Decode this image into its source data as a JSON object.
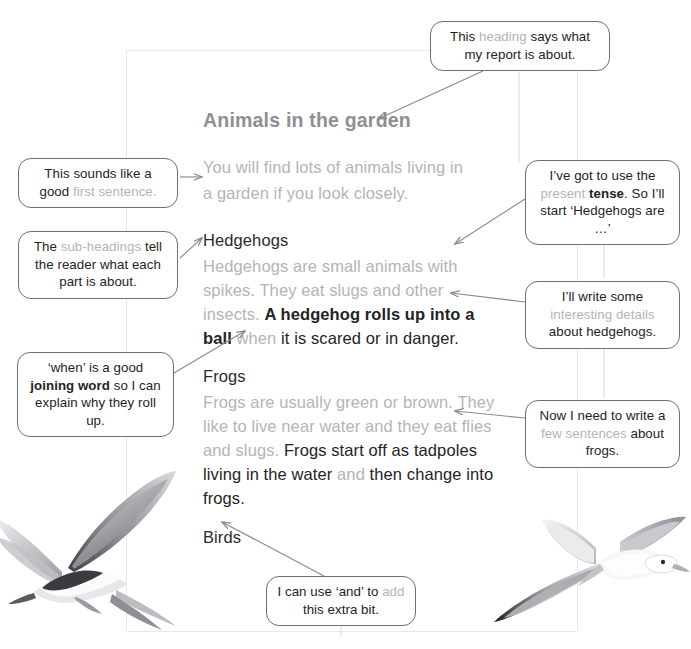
{
  "document": {
    "title": "Animals in the garden",
    "intro": {
      "line1": "You will find lots of animals living in",
      "line2": "a garden if you look closely."
    },
    "sections": [
      {
        "heading": "Hedgehogs",
        "grey_part": "Hedgehogs are small animals with spikes. They eat slugs and other insects. ",
        "dark_part": "A hedgehog rolls up into a ball",
        "joining_word": " when ",
        "dark_tail": "it is scared or in danger."
      },
      {
        "heading": "Frogs",
        "grey_part": "Frogs are usually green or brown. They like to live near water and they eat flies and slugs. ",
        "dark_part": "Frogs start off as tadpoles living in the water",
        "joining_word": " and ",
        "dark_tail": "then change into frogs."
      },
      {
        "heading": "Birds",
        "grey_part": "",
        "dark_part": "",
        "joining_word": "",
        "dark_tail": ""
      }
    ]
  },
  "callouts": {
    "heading": {
      "part1": "This ",
      "highlight": "heading",
      "part2": " says what my report is about."
    },
    "first_sentence": {
      "part1": "This sounds like a good ",
      "highlight": "first sentence."
    },
    "sub_headings": {
      "part1": "The ",
      "highlight": "sub-headings",
      "part2": " tell the reader what each part is about."
    },
    "joining_word": {
      "part1": "‘when’ is a good ",
      "bold": "joining word",
      "part2": " so I can explain why they roll up."
    },
    "present_tense": {
      "part1": "I’ve got to use the ",
      "highlight": "present ",
      "bold": "tense",
      "part2": ". So I’ll start ‘Hedgehogs are …’"
    },
    "interesting_details": {
      "part1": "I’ll write some ",
      "highlight": "interesting details",
      "part2": " about hedgehogs."
    },
    "few_sentences": {
      "part1": "Now I need to write a ",
      "highlight": "few sentences",
      "part2": " about frogs."
    },
    "extra_bit": {
      "part1": "I can use ‘and’ to ",
      "highlight": "add",
      "part2": " this extra bit."
    }
  },
  "images": {
    "left_bird": "flying-tern-illustration",
    "right_bird": "flying-seagull-illustration"
  },
  "colors": {
    "grey_text": "#b4b4b8",
    "dark_text": "#242424",
    "title_grey": "#8e8e93",
    "callout_border": "#6f6f72",
    "connector": "#8a8a8e",
    "page_border": "#e9e9ec"
  }
}
